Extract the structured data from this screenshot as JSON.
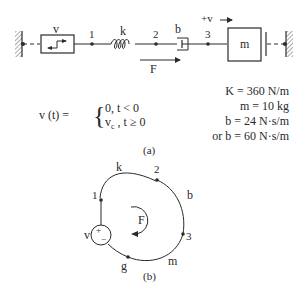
{
  "figure_a": {
    "source_label": "v",
    "node_1": "1",
    "spring_label": "k",
    "node_2": "2",
    "damper_label": "b",
    "node_3": "3",
    "mass_label": "m",
    "velocity_ref": "+v",
    "force_label": "F",
    "equation": {
      "lhs": "v (t) =",
      "case_1": "0, t < 0",
      "case_2_var": "v",
      "case_2_sub": "c",
      "case_2_rest": " , t ≥ 0"
    },
    "params": [
      "K = 360 N/m",
      "m = 10 kg",
      "b = 24 N·s/m",
      "or b = 60 N·s/m"
    ],
    "caption": "(a)"
  },
  "figure_b": {
    "labels": {
      "k": "k",
      "node_2": "2",
      "b": "b",
      "node_1": "1",
      "force": "F",
      "node_3": "3",
      "source": "v",
      "plus": "+",
      "minus": "−",
      "ground": "g",
      "m": "m"
    },
    "caption": "(b)"
  }
}
